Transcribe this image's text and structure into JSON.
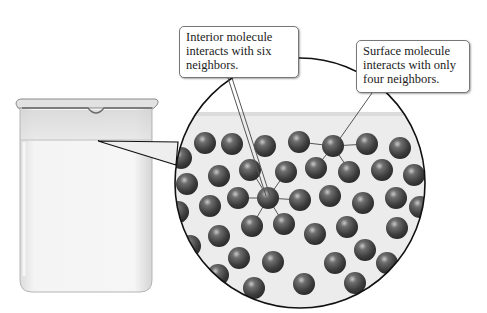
{
  "figure": {
    "callouts": {
      "interior": "Interior molecule interacts with six neighbors.",
      "surface": "Surface molecule interacts with only four neighbors."
    },
    "elements": {
      "beaker": "beaker of liquid",
      "magnified_view": "magnified view of molecules near liquid surface"
    },
    "colors": {
      "sphere": "#4a4a4a",
      "sphere_highlight": "#b8b8b8",
      "liquid": "#efefef",
      "outline": "#111111",
      "bond": "#555555"
    }
  }
}
